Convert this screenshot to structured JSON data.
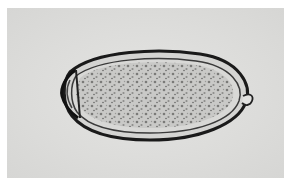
{
  "image": {
    "subject": "parasite egg micrograph",
    "description": "Grayscale brightfield micrograph of an oval operculated egg with granular contents; operculum at left end and small knob at right end",
    "colors": {
      "border": "#ffffff",
      "background": "#dcdcda",
      "shell": "#1a1a1a",
      "contents": "#b8b8b6"
    }
  }
}
